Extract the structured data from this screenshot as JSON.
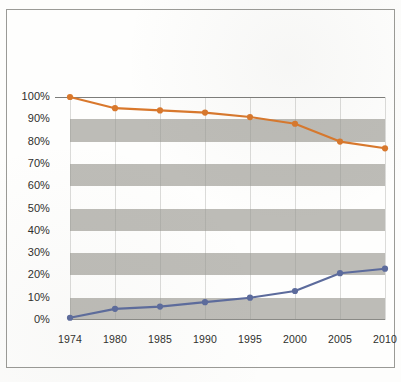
{
  "chart_data": {
    "type": "line",
    "title": "",
    "subtitle": "",
    "xlabel": "",
    "ylabel": "",
    "categories": [
      "1974",
      "1980",
      "1985",
      "1990",
      "1995",
      "2000",
      "2005",
      "2010"
    ],
    "series": [
      {
        "name": "declining-series",
        "color": "#d9782c",
        "values": [
          100,
          95,
          94,
          93,
          91,
          88,
          80,
          77
        ]
      },
      {
        "name": "rising-series",
        "color": "#5c6b9c",
        "values": [
          1,
          5,
          6,
          8,
          10,
          13,
          21,
          23
        ]
      }
    ],
    "ylim": [
      0,
      100
    ],
    "ytick_labels": [
      "100%",
      "90%",
      "80%",
      "70%",
      "60%",
      "50%",
      "40%",
      "30%",
      "20%",
      "10%",
      "0%"
    ],
    "ytick_values": [
      100,
      90,
      80,
      70,
      60,
      50,
      40,
      30,
      20,
      10,
      0
    ],
    "grid": true,
    "grid_style": "alternating-horizontal-bands",
    "band_ranges": [
      [
        80,
        90
      ],
      [
        60,
        70
      ],
      [
        40,
        50
      ],
      [
        20,
        30
      ],
      [
        0,
        10
      ]
    ],
    "band_color": "#b7b6b1",
    "legend": "none",
    "legend_position": "none",
    "annotations": []
  },
  "figure": {
    "border_color": "#9a9a96",
    "background": "#fefefd"
  }
}
